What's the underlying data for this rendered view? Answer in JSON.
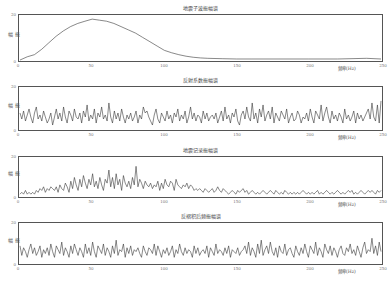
{
  "figure": {
    "x_label": "频率(Hz)",
    "y_label": "振幅",
    "x_ticks": [
      "0",
      "50",
      "100",
      "150",
      "200",
      "250"
    ],
    "y_ticks": [
      "0",
      "10",
      "20"
    ],
    "line_color": "#333333"
  },
  "chart_data": [
    {
      "type": "line",
      "title": "地震子波振幅谱",
      "xlabel": "频率(Hz)",
      "ylabel": "振幅",
      "xlim": [
        0,
        250
      ],
      "ylim": [
        0,
        20
      ],
      "grid": false,
      "x": [
        0,
        5,
        10,
        15,
        20,
        25,
        30,
        35,
        40,
        45,
        50,
        55,
        60,
        65,
        70,
        75,
        80,
        85,
        90,
        95,
        100,
        105,
        110,
        115,
        120,
        125,
        130,
        140,
        150,
        160,
        180,
        200,
        220,
        240,
        250
      ],
      "values": [
        0,
        1.5,
        2.5,
        5,
        8,
        11,
        13.5,
        15.5,
        17,
        18,
        19,
        18.5,
        18,
        17,
        15.5,
        14,
        12.5,
        10.5,
        8.5,
        6.5,
        4.5,
        3.4,
        2.5,
        1.8,
        1.3,
        1,
        0.8,
        0.6,
        0.5,
        0.5,
        0.5,
        0.5,
        0.5,
        0.8,
        0.5
      ]
    },
    {
      "type": "line",
      "title": "反射系数振幅谱",
      "xlabel": "频率(Hz)",
      "ylabel": "振幅",
      "xlim": [
        0,
        250
      ],
      "ylim": [
        0,
        20
      ],
      "grid": false,
      "x_step": 1.25,
      "values": [
        8,
        5,
        9,
        4,
        7,
        10,
        6,
        3,
        8,
        11,
        5,
        7,
        4,
        9,
        6,
        3,
        5,
        8,
        2,
        6,
        10,
        5,
        8,
        4,
        11,
        6,
        3,
        9,
        7,
        4,
        10,
        6,
        5,
        8,
        3,
        9,
        6,
        12,
        4,
        7,
        5,
        10,
        3,
        8,
        6,
        11,
        5,
        7,
        4,
        13,
        6,
        3,
        9,
        5,
        8,
        4,
        10,
        6,
        3,
        7,
        5,
        8,
        4,
        6,
        9,
        3,
        7,
        5,
        11,
        8,
        9,
        6,
        4,
        2,
        7,
        10,
        5,
        3,
        8,
        6,
        4,
        9,
        5,
        7,
        3,
        8,
        6,
        10,
        4,
        7,
        5,
        9,
        3,
        6,
        11,
        5,
        8,
        4,
        7,
        6,
        3,
        9,
        5,
        8,
        4,
        6,
        7,
        5,
        8,
        3,
        6,
        9,
        4,
        11,
        5,
        7,
        3,
        8,
        6,
        10,
        4,
        2,
        7,
        9,
        5,
        11,
        6,
        4,
        13,
        5,
        8,
        3,
        10,
        6,
        12,
        4,
        7,
        9,
        5,
        11,
        3,
        8,
        6,
        4,
        9,
        7,
        5,
        10,
        3,
        6,
        8,
        4,
        5,
        9,
        7,
        3,
        6,
        5,
        8,
        4,
        10,
        6,
        3,
        9,
        7,
        5,
        12,
        4,
        8,
        11,
        6,
        3,
        9,
        5,
        7,
        4,
        8,
        6,
        3,
        10,
        5,
        7,
        4,
        6,
        9,
        3,
        8,
        5,
        7,
        4,
        6,
        8,
        10,
        5,
        13,
        6,
        4,
        12,
        3,
        14
      ],
      "ylim_note": "values fluctuate roughly 2–14 around a mean ~6"
    },
    {
      "type": "line",
      "title": "地震记录振幅谱",
      "xlabel": "频率(Hz)",
      "ylabel": "振幅",
      "xlim": [
        0,
        250
      ],
      "ylim": [
        0,
        20
      ],
      "grid": false,
      "x_step": 1.25,
      "values": [
        1,
        2,
        1,
        3,
        1,
        2,
        1,
        2,
        1,
        3,
        2,
        4,
        3,
        5,
        2,
        4,
        3,
        5,
        4,
        3,
        5,
        2,
        6,
        4,
        3,
        7,
        5,
        2,
        8,
        4,
        10,
        6,
        3,
        9,
        5,
        11,
        7,
        4,
        9,
        6,
        12,
        5,
        8,
        4,
        10,
        6,
        3,
        9,
        7,
        14,
        5,
        10,
        4,
        12,
        6,
        9,
        3,
        11,
        7,
        5,
        8,
        4,
        10,
        6,
        16,
        5,
        9,
        7,
        4,
        8,
        6,
        5,
        7,
        4,
        6,
        5,
        8,
        3,
        7,
        4,
        9,
        6,
        5,
        8,
        7,
        3,
        9,
        6,
        5,
        4,
        6,
        5,
        7,
        4,
        6,
        5,
        3,
        4,
        3,
        4,
        3,
        2,
        4,
        3,
        2,
        3,
        4,
        2,
        3,
        5,
        3,
        2,
        4,
        3,
        2,
        1,
        2,
        3,
        2,
        1,
        3,
        2,
        3,
        4,
        2,
        3,
        1,
        2,
        3,
        2,
        1,
        2,
        1,
        2,
        3,
        2,
        1,
        2,
        3,
        2,
        1,
        3,
        2,
        1,
        2,
        1,
        3,
        2,
        1,
        2,
        1,
        2,
        1,
        2,
        1,
        2,
        3,
        2,
        1,
        2,
        1,
        2,
        1,
        2,
        3,
        1,
        2,
        1,
        2,
        3,
        2,
        1,
        2,
        1,
        2,
        3,
        2,
        1,
        2,
        1,
        2,
        3,
        2,
        3,
        1,
        2,
        1,
        2,
        3,
        2,
        1,
        2,
        3,
        2,
        3,
        2,
        1,
        3,
        2,
        3
      ]
    },
    {
      "type": "line",
      "title": "反褶积后频振幅谱",
      "xlabel": "频率(Hz)",
      "ylabel": "振幅",
      "xlim": [
        0,
        250
      ],
      "ylim": [
        0,
        20
      ],
      "grid": false,
      "x_step": 1.25,
      "values": [
        9,
        4,
        8,
        6,
        3,
        7,
        10,
        5,
        8,
        4,
        6,
        9,
        3,
        7,
        5,
        8,
        4,
        10,
        6,
        3,
        9,
        7,
        5,
        11,
        4,
        8,
        6,
        3,
        9,
        5,
        10,
        7,
        4,
        8,
        6,
        3,
        10,
        5,
        8,
        4,
        11,
        6,
        3,
        9,
        7,
        5,
        10,
        4,
        8,
        6,
        3,
        9,
        5,
        12,
        4,
        7,
        6,
        10,
        3,
        8,
        5,
        9,
        4,
        7,
        6,
        8,
        5,
        3,
        9,
        6,
        4,
        8,
        7,
        5,
        10,
        4,
        9,
        6,
        3,
        7,
        5,
        8,
        4,
        6,
        9,
        3,
        7,
        5,
        10,
        6,
        4,
        8,
        5,
        7,
        6,
        3,
        9,
        5,
        8,
        4,
        6,
        7,
        5,
        9,
        3,
        8,
        6,
        4,
        10,
        5,
        7,
        6,
        4,
        8,
        5,
        9,
        3,
        7,
        6,
        5,
        8,
        4,
        6,
        7,
        9,
        5,
        11,
        4,
        8,
        6,
        3,
        10,
        5,
        12,
        4,
        7,
        9,
        5,
        11,
        6,
        4,
        8,
        3,
        9,
        6,
        5,
        10,
        4,
        7,
        8,
        5,
        3,
        9,
        6,
        4,
        8,
        5,
        10,
        6,
        3,
        9,
        7,
        5,
        11,
        4,
        8,
        6,
        3,
        10,
        7,
        5,
        9,
        4,
        8,
        6,
        3,
        7,
        9,
        5,
        4,
        8,
        6,
        10,
        5,
        7,
        4,
        9,
        6,
        3,
        8,
        11,
        5,
        7,
        6,
        13,
        5,
        9,
        4,
        11,
        6
      ]
    }
  ]
}
